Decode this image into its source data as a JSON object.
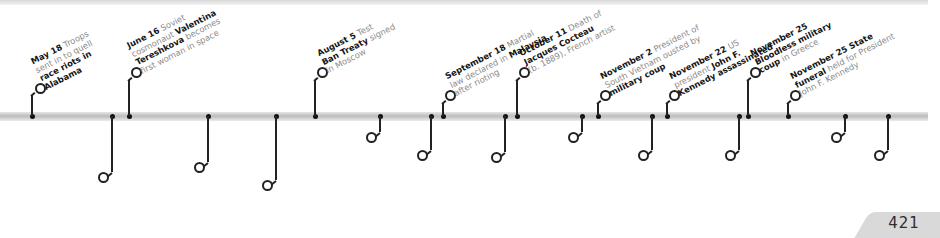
{
  "page": {
    "number": "421"
  },
  "timeline": {
    "year": "1963",
    "events": [
      {
        "side": "up",
        "x": 32,
        "stem_to": 95,
        "ring_x": 40,
        "ring_y": 88,
        "lines": [
          [
            {
              "b": "May 18"
            },
            {
              "t": " Troops"
            }
          ],
          [
            {
              "t": "sent in to quell"
            }
          ],
          [
            {
              "b": "race riots in"
            }
          ],
          [
            {
              "b": "Alabama"
            }
          ]
        ]
      },
      {
        "side": "down",
        "x": 112,
        "stem_to": 172,
        "ring_x": 103,
        "ring_y": 177,
        "lines": [
          [
            {
              "b": "May 25"
            },
            {
              "t": " Organization"
            }
          ],
          [
            {
              "t": "of African Unity"
            }
          ],
          [
            {
              "t": "("
            },
            {
              "b": "OAU"
            },
            {
              "t": ") founded"
            }
          ]
        ]
      },
      {
        "side": "up",
        "x": 129,
        "stem_to": 80,
        "ring_x": 136,
        "ring_y": 72,
        "lines": [
          [
            {
              "b": "June 16"
            },
            {
              "t": " Soviet"
            }
          ],
          [
            {
              "t": "cosmonaut "
            },
            {
              "b": "Valentina"
            }
          ],
          [
            {
              "b": "Tereshkova"
            },
            {
              "t": " becomes"
            }
          ],
          [
            {
              "t": "first woman in space"
            }
          ]
        ]
      },
      {
        "side": "down",
        "x": 208,
        "stem_to": 162,
        "ring_x": 199,
        "ring_y": 167,
        "lines": [
          [
            {
              "b": "June 26 President"
            }
          ],
          [
            {
              "b": "Kennedy"
            },
            {
              "t": " makes inspiring"
            }
          ],
          [
            {
              "t": "speech in Berlin"
            }
          ]
        ]
      },
      {
        "side": "down",
        "x": 276,
        "stem_to": 180,
        "ring_x": 267,
        "ring_y": 185,
        "lines": [
          [
            {
              "b": "July 26"
            },
            {
              "t": " City of"
            }
          ],
          [
            {
              "b": "Skopje"
            },
            {
              "t": ", Yugoslavia,"
            }
          ],
          [
            {
              "t": "destroyed by"
            }
          ],
          [
            {
              "t": "earthquake"
            }
          ]
        ]
      },
      {
        "side": "up",
        "x": 315,
        "stem_to": 80,
        "ring_x": 322,
        "ring_y": 72,
        "lines": [
          [
            {
              "b": "August 5"
            },
            {
              "t": " Test"
            }
          ],
          [
            {
              "b": "Ban Treaty"
            },
            {
              "t": " signed"
            }
          ],
          [
            {
              "t": "in Moscow"
            }
          ]
        ]
      },
      {
        "side": "down",
        "x": 380,
        "stem_to": 132,
        "ring_x": 371,
        "ring_y": 137,
        "lines": [
          [
            {
              "b": "August 28"
            },
            {
              "t": " "
            },
            {
              "b": "'March on"
            }
          ],
          [
            {
              "b": "Washington'"
            }
          ]
        ]
      },
      {
        "side": "down",
        "x": 431,
        "stem_to": 150,
        "ring_x": 422,
        "ring_y": 155,
        "lines": [
          [
            {
              "b": "September 16"
            },
            {
              "t": " Malaya"
            }
          ],
          [
            {
              "t": "becomes "
            },
            {
              "b": "Federation"
            }
          ],
          [
            {
              "b": "of Malaysia"
            }
          ]
        ]
      },
      {
        "side": "up",
        "x": 443,
        "stem_to": 103,
        "ring_x": 450,
        "ring_y": 95,
        "lines": [
          [
            {
              "b": "September 18"
            },
            {
              "t": " Martial"
            }
          ],
          [
            {
              "t": "law declared in "
            },
            {
              "b": "Malaysia"
            }
          ],
          [
            {
              "t": "after rioting"
            }
          ]
        ]
      },
      {
        "side": "down",
        "x": 505,
        "stem_to": 152,
        "ring_x": 496,
        "ring_y": 157,
        "lines": [
          [
            {
              "b": "September 24"
            },
            {
              "t": " First "
            },
            {
              "b": "blood"
            }
          ],
          [
            {
              "b": "transfusion"
            },
            {
              "t": " given to unborn"
            }
          ],
          [
            {
              "t": "baby, New Zealand"
            }
          ]
        ]
      },
      {
        "side": "up",
        "x": 517,
        "stem_to": 80,
        "ring_x": 524,
        "ring_y": 72,
        "lines": [
          [
            {
              "b": "October 11"
            },
            {
              "t": " Death of"
            }
          ],
          [
            {
              "b": "Jacques Cocteau"
            }
          ],
          [
            {
              "t": "(b. 1889), French artist"
            }
          ]
        ]
      },
      {
        "side": "down",
        "x": 582,
        "stem_to": 132,
        "ring_x": 573,
        "ring_y": 137,
        "lines": [
          [
            {
              "b": "October 21 UN"
            },
            {
              "t": " votes against"
            }
          ],
          [
            {
              "t": "admitting communist China"
            }
          ]
        ]
      },
      {
        "side": "up",
        "x": 598,
        "stem_to": 103,
        "ring_x": 605,
        "ring_y": 95,
        "lines": [
          [
            {
              "b": "November 2"
            },
            {
              "t": " President of"
            }
          ],
          [
            {
              "t": "South Vietnam ousted by"
            }
          ],
          [
            {
              "b": "military coup"
            }
          ]
        ]
      },
      {
        "side": "down",
        "x": 652,
        "stem_to": 150,
        "ring_x": 643,
        "ring_y": 155,
        "lines": [
          [
            {
              "b": "November 7"
            },
            {
              "t": " US"
            }
          ],
          [
            {
              "t": "recognizes the new"
            }
          ],
          [
            {
              "b": "South Vietnamese"
            }
          ],
          [
            {
              "b": "government"
            }
          ]
        ]
      },
      {
        "side": "up",
        "x": 667,
        "stem_to": 103,
        "ring_x": 674,
        "ring_y": 95,
        "lines": [
          [
            {
              "b": "November 22"
            },
            {
              "t": " US"
            }
          ],
          [
            {
              "t": "president "
            },
            {
              "b": "John F."
            }
          ],
          [
            {
              "b": "Kennedy assassinated"
            }
          ]
        ]
      },
      {
        "side": "down",
        "x": 739,
        "stem_to": 150,
        "ring_x": 730,
        "ring_y": 155,
        "lines": [
          [
            {
              "b": "November 22"
            },
            {
              "t": " Vice"
            }
          ],
          [
            {
              "t": "President "
            },
            {
              "b": "Lyndon B."
            }
          ],
          [
            {
              "b": "Johnson"
            },
            {
              "t": " sworn in as"
            }
          ],
          [
            {
              "t": "US president"
            }
          ]
        ]
      },
      {
        "side": "up",
        "x": 748,
        "stem_to": 80,
        "ring_x": 755,
        "ring_y": 72,
        "lines": [
          [
            {
              "b": "November 25"
            }
          ],
          [
            {
              "b": "Bloodless military"
            }
          ],
          [
            {
              "b": "coup"
            },
            {
              "t": " in Greece"
            }
          ]
        ]
      },
      {
        "side": "up",
        "x": 788,
        "stem_to": 103,
        "ring_x": 795,
        "ring_y": 95,
        "lines": [
          [
            {
              "b": "November 25 State"
            }
          ],
          [
            {
              "b": "funeral"
            },
            {
              "t": " held for President"
            }
          ],
          [
            {
              "t": "John F. Kennedy"
            }
          ]
        ]
      },
      {
        "side": "down",
        "x": 845,
        "stem_to": 132,
        "ring_x": 836,
        "ring_y": 137,
        "lines": [
          [
            {
              "b": "November 29 Warren"
            }
          ],
          [
            {
              "b": "Commission"
            },
            {
              "t": " set up to investigate"
            }
          ],
          [
            {
              "t": "Kennedy's assassination"
            }
          ]
        ]
      },
      {
        "side": "down",
        "x": 888,
        "stem_to": 150,
        "ring_x": 879,
        "ring_y": 155,
        "lines": [
          [
            {
              "b": "December 12 Kenya"
            }
          ],
          [
            {
              "t": "gains independence"
            }
          ],
          [
            {
              "t": "from British rule"
            }
          ]
        ]
      }
    ]
  }
}
